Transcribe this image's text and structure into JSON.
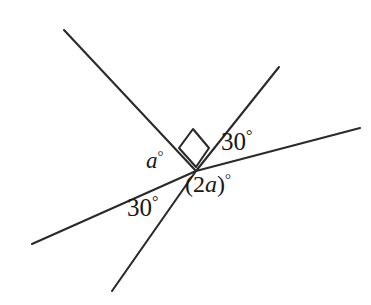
{
  "figure": {
    "background_color": "#ffffff",
    "stroke_color": "#2a2a2a",
    "text_color": "#171717",
    "width": 371,
    "height": 305,
    "vertex": {
      "x": 196,
      "y": 171
    },
    "labels": {
      "angle_a": {
        "variable": "a",
        "degree_symbol": "°"
      },
      "angle_two_a": {
        "expression": "(2",
        "variable": "a",
        "close": ")",
        "degree_symbol": "°"
      },
      "angle_30_upper_right": {
        "value": "30",
        "degree_symbol": "°"
      },
      "angle_30_lower_left": {
        "value": "30",
        "degree_symbol": "°"
      }
    },
    "marks": {
      "right_angle_square": {
        "name": "right-angle-marker",
        "points": "193,129 209,148 196,167 179,148"
      }
    },
    "lines": [
      {
        "name": "line-upper-left-ray",
        "from": {
          "x": 64,
          "y": 30
        },
        "to": {
          "x": 196,
          "y": 171
        }
      },
      {
        "name": "line-lower-left-ray",
        "from": {
          "x": 196,
          "y": 171
        },
        "to": {
          "x": 112,
          "y": 291
        }
      },
      {
        "name": "line-upper-right-ray",
        "from": {
          "x": 196,
          "y": 171
        },
        "to": {
          "x": 279,
          "y": 67
        }
      },
      {
        "name": "line-shallow-left-ray",
        "from": {
          "x": 196,
          "y": 171
        },
        "to": {
          "x": 32,
          "y": 244
        }
      },
      {
        "name": "line-shallow-right-ray",
        "from": {
          "x": 196,
          "y": 171
        },
        "to": {
          "x": 360,
          "y": 128
        }
      }
    ]
  }
}
